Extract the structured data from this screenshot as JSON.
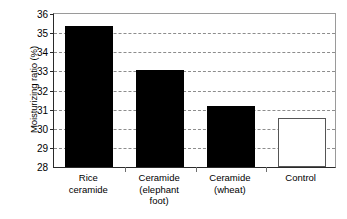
{
  "chart_data": {
    "type": "bar",
    "title": "",
    "xlabel": "",
    "ylabel": "Moisturizing ratio (%)",
    "ylim": [
      28,
      36
    ],
    "yticks": [
      28,
      29,
      30,
      31,
      32,
      33,
      34,
      35,
      36
    ],
    "ytick_labels": [
      "28",
      "29",
      "30",
      "31",
      "32",
      "33",
      "34",
      "35",
      "36"
    ],
    "grid": true,
    "grid_style": "dashed-horizontal",
    "legend": "none",
    "categories": [
      "Rice ceramide",
      "Ceramide (elephant foot)",
      "Ceramide (wheat)",
      "Control"
    ],
    "category_lines": [
      [
        "Rice",
        "ceramide"
      ],
      [
        "Ceramide",
        "(elephant",
        "foot)"
      ],
      [
        "Ceramide",
        "(wheat)"
      ],
      [
        "Control"
      ]
    ],
    "values": [
      35.35,
      33.05,
      31.2,
      30.55
    ],
    "bar_styles": [
      "filled",
      "filled",
      "filled",
      "outlined"
    ],
    "colors": {
      "bar_fill": "#000000",
      "bar_outline_fill": "#ffffff",
      "bar_outline_stroke": "#555555",
      "gridline": "#8d8d8d",
      "axis": "#2a2a2a",
      "frame": "#9a9a9a",
      "background": "#ffffff",
      "text": "#000000"
    }
  }
}
